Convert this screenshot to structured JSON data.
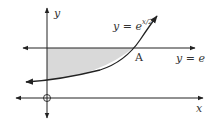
{
  "diagram": {
    "axes": {
      "x_label": "x",
      "y_label": "y",
      "origin_marker": "circle-cross"
    },
    "curve": {
      "label_prefix": "y = e",
      "exponent": "x/2",
      "equation": "y = e^(x/2)"
    },
    "line": {
      "label": "y = e",
      "equation": "y = e"
    },
    "intersection": {
      "label": "A"
    },
    "shaded_region": {
      "description": "region bounded by y-axis, y = e, and y = e^(x/2)",
      "color": "#d9d9d9"
    },
    "colors": {
      "stroke": "#222222",
      "shade": "#d9d9d9"
    }
  }
}
